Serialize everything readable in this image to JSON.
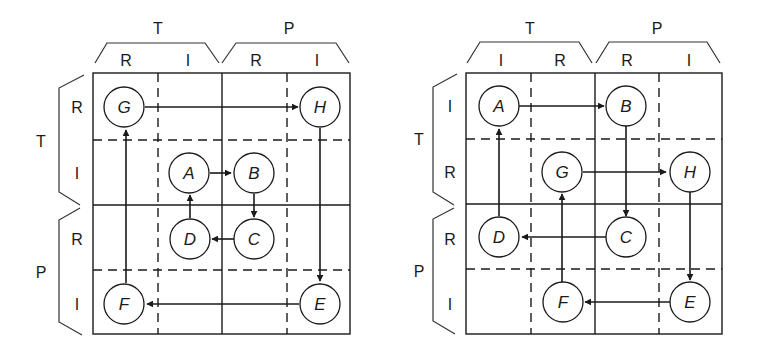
{
  "diagrams": [
    {
      "id": "left",
      "col_groups": [
        {
          "label": "T"
        },
        {
          "label": "P"
        }
      ],
      "col_labels": [
        "R",
        "I",
        "R",
        "I"
      ],
      "row_groups": [
        {
          "label": "T"
        },
        {
          "label": "P"
        }
      ],
      "row_labels": [
        "R",
        "I",
        "R",
        "I"
      ],
      "nodes": [
        {
          "id": "G",
          "label": "G",
          "row": 0,
          "col": 0
        },
        {
          "id": "H",
          "label": "H",
          "row": 0,
          "col": 3
        },
        {
          "id": "A",
          "label": "A",
          "row": 1,
          "col": 1
        },
        {
          "id": "B",
          "label": "B",
          "row": 1,
          "col": 2
        },
        {
          "id": "D",
          "label": "D",
          "row": 2,
          "col": 1
        },
        {
          "id": "C",
          "label": "C",
          "row": 2,
          "col": 2
        },
        {
          "id": "F",
          "label": "F",
          "row": 3,
          "col": 0
        },
        {
          "id": "E",
          "label": "E",
          "row": 3,
          "col": 3
        }
      ],
      "edges": [
        {
          "from": "G",
          "to": "H"
        },
        {
          "from": "H",
          "to": "E"
        },
        {
          "from": "E",
          "to": "F"
        },
        {
          "from": "F",
          "to": "G"
        },
        {
          "from": "A",
          "to": "B"
        },
        {
          "from": "B",
          "to": "C"
        },
        {
          "from": "C",
          "to": "D"
        },
        {
          "from": "D",
          "to": "A"
        }
      ]
    },
    {
      "id": "right",
      "col_groups": [
        {
          "label": "T"
        },
        {
          "label": "P"
        }
      ],
      "col_labels": [
        "I",
        "R",
        "R",
        "I"
      ],
      "row_groups": [
        {
          "label": "T"
        },
        {
          "label": "P"
        }
      ],
      "row_labels": [
        "I",
        "R",
        "R",
        "I"
      ],
      "nodes": [
        {
          "id": "A",
          "label": "A",
          "row": 0,
          "col": 0
        },
        {
          "id": "B",
          "label": "B",
          "row": 0,
          "col": 2
        },
        {
          "id": "G",
          "label": "G",
          "row": 1,
          "col": 1
        },
        {
          "id": "H",
          "label": "H",
          "row": 1,
          "col": 3
        },
        {
          "id": "D",
          "label": "D",
          "row": 2,
          "col": 0
        },
        {
          "id": "C",
          "label": "C",
          "row": 2,
          "col": 2
        },
        {
          "id": "F",
          "label": "F",
          "row": 3,
          "col": 1
        },
        {
          "id": "E",
          "label": "E",
          "row": 3,
          "col": 3
        }
      ],
      "edges": [
        {
          "from": "A",
          "to": "B"
        },
        {
          "from": "B",
          "to": "C"
        },
        {
          "from": "C",
          "to": "D"
        },
        {
          "from": "D",
          "to": "A"
        },
        {
          "from": "G",
          "to": "H"
        },
        {
          "from": "H",
          "to": "E"
        },
        {
          "from": "E",
          "to": "F"
        },
        {
          "from": "F",
          "to": "G"
        }
      ]
    }
  ]
}
